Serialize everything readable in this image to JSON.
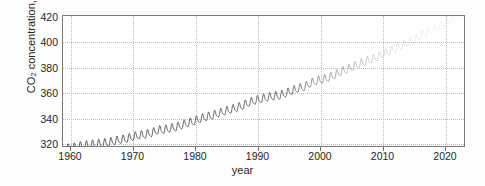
{
  "figure": {
    "background": "#fdfdfd",
    "axes_color": "#7a7a7a",
    "grid_color": "#bdbdbd",
    "line_color": "#333333"
  },
  "axis": {
    "xlabel": "year",
    "ylabel_main": "CO",
    "ylabel_sub": "2",
    "ylabel_rest": " concentration, ppm",
    "xticks": [
      "1960",
      "1970",
      "1980",
      "1990",
      "2000",
      "2010",
      "2020"
    ],
    "yticks": [
      "320",
      "340",
      "360",
      "380",
      "400",
      "420"
    ]
  },
  "chart_data": {
    "type": "line",
    "title": "",
    "xlabel": "year",
    "ylabel": "CO2 concentration, ppm",
    "xlim": [
      1957.5,
      2023.5
    ],
    "ylim": [
      316,
      420
    ],
    "grid": true,
    "legend": null,
    "xticks": [
      1960,
      1970,
      1980,
      1990,
      2000,
      2010,
      2020
    ],
    "yticks": [
      320,
      340,
      360,
      380,
      400,
      420
    ],
    "series": [
      {
        "name": "Monthly mean CO2 (Mauna Loa)",
        "x": [
          1958,
          1959,
          1960,
          1961,
          1962,
          1963,
          1964,
          1965,
          1966,
          1967,
          1968,
          1969,
          1970,
          1971,
          1972,
          1973,
          1974,
          1975,
          1976,
          1977,
          1978,
          1979,
          1980,
          1981,
          1982,
          1983,
          1984,
          1985,
          1986,
          1987,
          1988,
          1989,
          1990,
          1991,
          1992,
          1993,
          1994,
          1995,
          1996,
          1997,
          1998,
          1999,
          2000,
          2001,
          2002,
          2003,
          2004,
          2005,
          2006,
          2007,
          2008,
          2009,
          2010,
          2011,
          2012,
          2013,
          2014,
          2015,
          2016,
          2017,
          2018,
          2019,
          2020,
          2021,
          2022,
          2023
        ],
        "values": [
          315.3,
          315.9,
          316.9,
          317.6,
          318.4,
          318.9,
          319.5,
          320.0,
          321.4,
          322.2,
          323.0,
          324.6,
          325.7,
          326.3,
          327.5,
          329.7,
          330.2,
          331.1,
          332.0,
          333.8,
          335.4,
          336.8,
          338.8,
          340.1,
          341.4,
          343.0,
          344.6,
          346.0,
          347.4,
          349.2,
          351.6,
          353.1,
          354.4,
          355.6,
          356.4,
          357.1,
          358.8,
          360.8,
          362.6,
          363.7,
          366.7,
          368.4,
          369.6,
          371.1,
          373.2,
          375.8,
          377.5,
          379.8,
          381.9,
          383.8,
          385.6,
          387.4,
          389.9,
          391.7,
          393.9,
          396.5,
          398.7,
          400.8,
          404.2,
          406.6,
          408.5,
          411.4,
          414.2,
          416.4,
          418.5,
          420.0
        ],
        "seasonal_amplitude_ppm": 6.0
      }
    ]
  }
}
